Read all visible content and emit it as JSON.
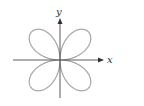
{
  "diagram": {
    "type": "polar-rose",
    "axes": {
      "x_label": "x",
      "y_label": "y"
    },
    "colors": {
      "curve": "#a6a6a6",
      "axis": "#333333"
    }
  }
}
